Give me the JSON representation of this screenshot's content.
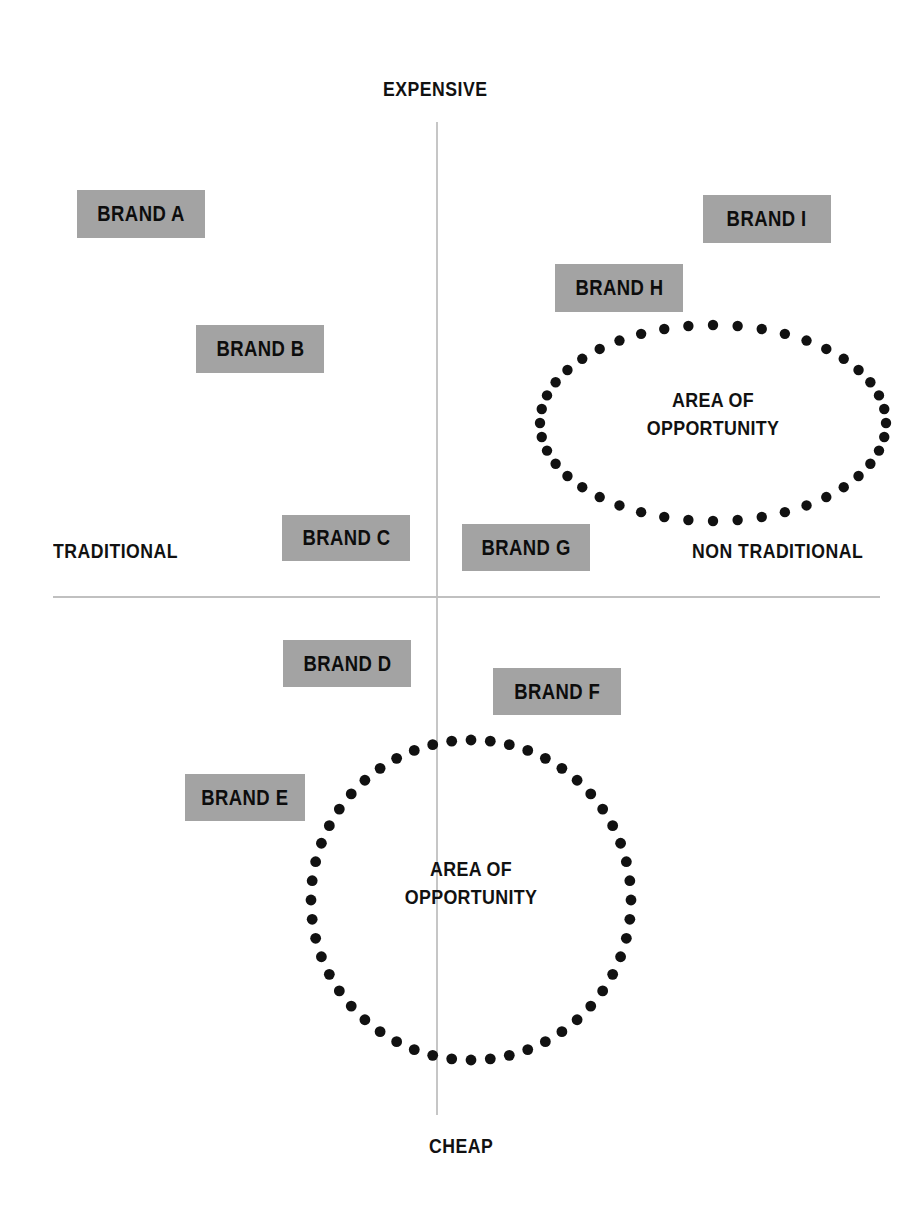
{
  "chart_data": {
    "type": "scatter",
    "xlabel": "Traditional — Non Traditional",
    "ylabel": "Cheap — Expensive",
    "axes": {
      "top": "EXPENSIVE",
      "bottom": "CHEAP",
      "left": "TRADITIONAL",
      "right": "NON TRADITIONAL"
    },
    "xlim": [
      -1,
      1
    ],
    "ylim": [
      -1,
      1
    ],
    "grid": false,
    "legend": "none",
    "points": [
      {
        "label": "BRAND A",
        "x": -0.72,
        "y": 0.78,
        "quadrant": "traditional-expensive"
      },
      {
        "label": "BRAND B",
        "x": -0.42,
        "y": 0.58,
        "quadrant": "traditional-expensive"
      },
      {
        "label": "BRAND C",
        "x": -0.18,
        "y": 0.15,
        "quadrant": "traditional-expensive"
      },
      {
        "label": "BRAND D",
        "x": -0.18,
        "y": -0.08,
        "quadrant": "traditional-cheap"
      },
      {
        "label": "BRAND E",
        "x": -0.55,
        "y": -0.35,
        "quadrant": "traditional-cheap"
      },
      {
        "label": "BRAND F",
        "x": 0.21,
        "y": -0.15,
        "quadrant": "non-traditional-cheap"
      },
      {
        "label": "BRAND G",
        "x": 0.13,
        "y": 0.12,
        "quadrant": "non-traditional-expensive"
      },
      {
        "label": "BRAND H",
        "x": 0.36,
        "y": 0.66,
        "quadrant": "non-traditional-expensive"
      },
      {
        "label": "BRAND I",
        "x": 0.73,
        "y": 0.79,
        "quadrant": "non-traditional-expensive"
      }
    ],
    "annotations": [
      {
        "label": "AREA OF OPPORTUNITY",
        "shape": "ellipse",
        "cx": 0.6,
        "cy": 0.37,
        "quadrant": "non-traditional-expensive"
      },
      {
        "label": "AREA OF OPPORTUNITY",
        "shape": "circle",
        "cx": 0.08,
        "cy": -0.59,
        "quadrant": "cheap-center"
      }
    ]
  },
  "axis_labels": {
    "top": "EXPENSIVE",
    "bottom": "CHEAP",
    "left": "TRADITIONAL",
    "right": "NON TRADITIONAL"
  },
  "brands": [
    {
      "label": "BRAND A"
    },
    {
      "label": "BRAND B"
    },
    {
      "label": "BRAND C"
    },
    {
      "label": "BRAND D"
    },
    {
      "label": "BRAND E"
    },
    {
      "label": "BRAND F"
    },
    {
      "label": "BRAND G"
    },
    {
      "label": "BRAND H"
    },
    {
      "label": "BRAND I"
    }
  ],
  "opportunity_zones": [
    {
      "line1": "AREA OF",
      "line2": "OPPORTUNITY"
    },
    {
      "line1": "AREA OF",
      "line2": "OPPORTUNITY"
    }
  ],
  "colors": {
    "background": "#ffffff",
    "chip_fill": "#a3a3a3",
    "text": "#111111",
    "axis_line": "#c3c3c3",
    "dot": "#111111"
  }
}
